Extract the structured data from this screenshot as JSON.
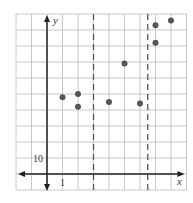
{
  "chart_data": {
    "type": "scatter",
    "title": "",
    "xlabel": "x",
    "ylabel": "y",
    "xlim": [
      -2,
      9
    ],
    "ylim": [
      -10,
      100
    ],
    "x_tick_step": 1,
    "y_tick_step": 10,
    "tick_labels": {
      "x": [
        "1"
      ],
      "y": [
        "10"
      ]
    },
    "grid": true,
    "points": [
      {
        "x": 1,
        "y": 48
      },
      {
        "x": 2,
        "y": 50
      },
      {
        "x": 2,
        "y": 42
      },
      {
        "x": 4,
        "y": 45
      },
      {
        "x": 5,
        "y": 69
      },
      {
        "x": 6,
        "y": 44
      },
      {
        "x": 7,
        "y": 93
      },
      {
        "x": 7,
        "y": 82
      },
      {
        "x": 8,
        "y": 96
      }
    ],
    "vertical_dashed_lines": [
      3,
      6.5
    ],
    "legend": null
  },
  "labels": {
    "x_axis": "x",
    "y_axis": "y",
    "x_tick": "1",
    "y_tick": "10"
  },
  "colors": {
    "grid": "#c8c8c8",
    "axis": "#222222",
    "point": "#555555",
    "dashed": "#555555"
  }
}
